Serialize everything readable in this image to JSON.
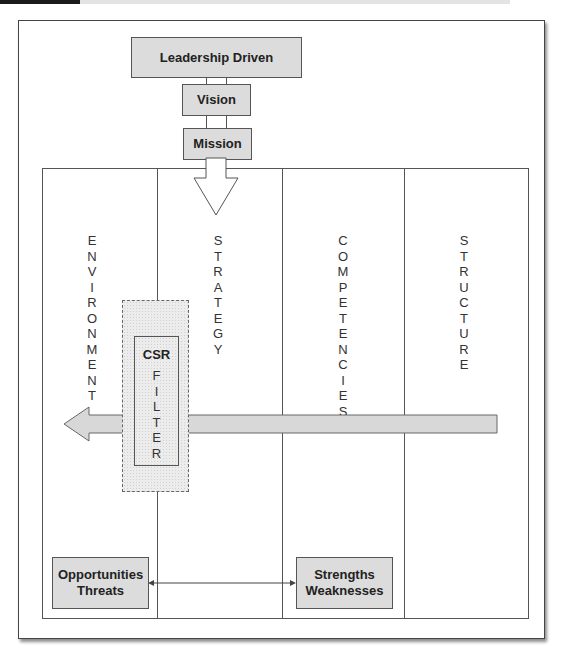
{
  "diagram": {
    "top_boxes": {
      "leadership": "Leadership Driven",
      "vision": "Vision",
      "mission": "Mission"
    },
    "columns": [
      {
        "label": "ENVIRONMENT",
        "letters": "E\nN\nV\nI\nR\nO\nN\nM\nE\nN\nT"
      },
      {
        "label": "STRATEGY",
        "letters": "S\nT\nR\nA\nT\nE\nG\nY"
      },
      {
        "label": "COMPETENCIES",
        "letters": "C\nO\nM\nP\nE\nT\nE\nN\nC\nI\nE\nS"
      },
      {
        "label": "STRUCTURE",
        "letters": "S\nT\nR\nU\nC\nT\nU\nR\nE"
      }
    ],
    "filter": {
      "title": "CSR",
      "letters": "F\nI\nL\nT\nE\nR"
    },
    "bottom_boxes": {
      "external": {
        "line1": "Opportunities",
        "line2": "Threats"
      },
      "internal": {
        "line1": "Strengths",
        "line2": "Weaknesses"
      }
    },
    "colors": {
      "box_fill": "#dcdcdc",
      "line": "#555555",
      "arrow_fill": "#d8d8d8"
    }
  }
}
